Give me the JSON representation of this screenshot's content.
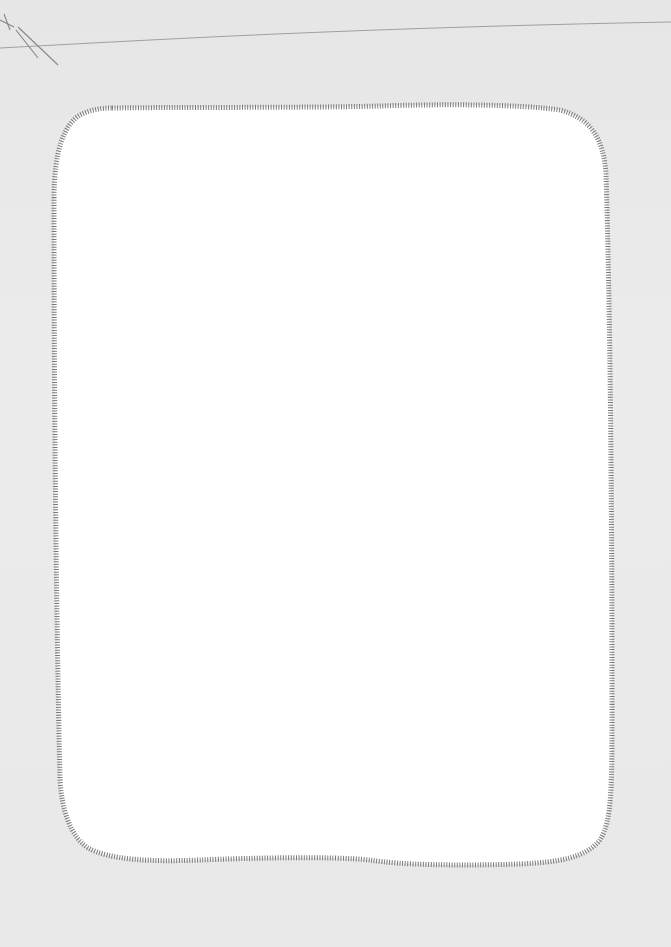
{
  "page": {
    "background_color": "#e9e9e9",
    "frame_fill": "#ffffff",
    "frame_border_color": "#7a7a7a",
    "frame_border_style": "stitched",
    "corner_marks": "pencil-strokes"
  }
}
